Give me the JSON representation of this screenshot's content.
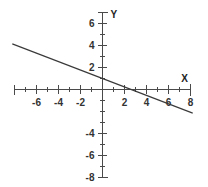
{
  "chart_data": {
    "type": "line",
    "title": "",
    "subtitle": "",
    "xlabel": "X",
    "ylabel": "Y",
    "xlim": [
      -8,
      8
    ],
    "ylim": [
      -8,
      7
    ],
    "grid": false,
    "legend": null,
    "x_tick_labels": [
      "-6",
      "-4",
      "-2",
      "2",
      "4",
      "6",
      "8"
    ],
    "x_tick_values": [
      -6,
      -4,
      -2,
      2,
      4,
      6,
      8
    ],
    "x_minor_ticks": [
      -7,
      -5,
      -3,
      -1,
      1,
      3,
      5,
      7
    ],
    "y_tick_labels": [
      "6",
      "4",
      "2",
      "-4",
      "-6",
      "-8"
    ],
    "y_tick_values": [
      6,
      4,
      2,
      -4,
      -6,
      -8
    ],
    "y_minor_ticks": [
      7,
      5,
      3,
      1,
      -1,
      -2,
      -3,
      -5,
      -7
    ],
    "series": [
      {
        "name": "line",
        "x": [
          -8.2,
          8.2
        ],
        "y": [
          4.15,
          -2.15
        ],
        "slope": -0.35,
        "intercept": 1.3,
        "x_intercept": 3.7,
        "color": "#3a3a3a"
      }
    ],
    "annotations": []
  },
  "axes": {
    "x_axis_name": "X",
    "y_axis_name": "Y"
  },
  "colors": {
    "background": "#ffffff",
    "axis": "#4a4a4a",
    "line": "#3a3a3a",
    "label": "#333333"
  }
}
